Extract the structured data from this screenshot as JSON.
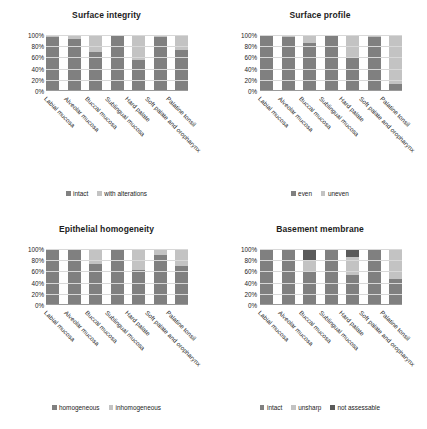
{
  "colors": {
    "dark": "#808080",
    "light": "#c3c3c3",
    "darkest": "#5a5a5a",
    "gridline": "#d8d8d8",
    "text": "#232323"
  },
  "axis": {
    "ticks": [
      "100%",
      "80%",
      "60%",
      "40%",
      "20%",
      "0%"
    ],
    "ymin": 0,
    "ymax": 100
  },
  "categories": [
    "Labial mucosa",
    "Alveolar mucosa",
    "Buccal mucosa",
    "Sublingual mucosa",
    "Hard palate",
    "Soft palate and oropharynx",
    "Palatine tonsil"
  ],
  "chart_data": [
    {
      "type": "bar",
      "id": "surface-integrity",
      "title": "Surface integrity",
      "xlabel": "",
      "ylabel": "",
      "ylim": [
        0,
        100
      ],
      "stacked": true,
      "grid": true,
      "legend_position": "bottom",
      "categories": [
        "Labial mucosa",
        "Alveolar mucosa",
        "Buccal mucosa",
        "Sublingual mucosa",
        "Hard palate",
        "Soft palate and oropharynx",
        "Palatine tonsil"
      ],
      "series": [
        {
          "name": "intact",
          "color": "#808080",
          "values": [
            96,
            92,
            69,
            100,
            55,
            96,
            74
          ]
        },
        {
          "name": "with alterations",
          "color": "#c3c3c3",
          "values": [
            4,
            8,
            31,
            0,
            45,
            4,
            26
          ]
        }
      ]
    },
    {
      "type": "bar",
      "id": "surface-profile",
      "title": "Surface profile",
      "xlabel": "",
      "ylabel": "",
      "ylim": [
        0,
        100
      ],
      "stacked": true,
      "grid": true,
      "legend_position": "bottom",
      "categories": [
        "Labial mucosa",
        "Alveolar mucosa",
        "Buccal mucosa",
        "Sublingual mucosa",
        "Hard palate",
        "Soft palate and oropharynx",
        "Palatine tonsil"
      ],
      "series": [
        {
          "name": "even",
          "color": "#808080",
          "values": [
            100,
            96,
            85,
            100,
            61,
            96,
            12
          ]
        },
        {
          "name": "uneven",
          "color": "#c3c3c3",
          "values": [
            0,
            4,
            15,
            0,
            39,
            4,
            88
          ]
        }
      ]
    },
    {
      "type": "bar",
      "id": "epithelial-homogeneity",
      "title": "Epithelial homogeneity",
      "xlabel": "",
      "ylabel": "",
      "ylim": [
        0,
        100
      ],
      "stacked": true,
      "grid": true,
      "legend_position": "bottom",
      "categories": [
        "Labial mucosa",
        "Alveolar mucosa",
        "Buccal mucosa",
        "Sublingual mucosa",
        "Hard palate",
        "Soft palate and oropharynx",
        "Palatine tonsil"
      ],
      "series": [
        {
          "name": "homogeneous",
          "color": "#808080",
          "values": [
            100,
            100,
            74,
            100,
            62,
            89,
            70
          ]
        },
        {
          "name": "inhomogeneous",
          "color": "#c3c3c3",
          "values": [
            0,
            0,
            26,
            0,
            38,
            11,
            30
          ]
        }
      ]
    },
    {
      "type": "bar",
      "id": "basement-membrane",
      "title": "Basement membrane",
      "xlabel": "",
      "ylabel": "",
      "ylim": [
        0,
        100
      ],
      "stacked": true,
      "grid": true,
      "legend_position": "bottom",
      "categories": [
        "Labial mucosa",
        "Alveolar mucosa",
        "Buccal mucosa",
        "Sublingual mucosa",
        "Hard palate",
        "Soft palate and oropharynx",
        "Palatine tonsil"
      ],
      "series": [
        {
          "name": "intact",
          "color": "#808080",
          "values": [
            100,
            100,
            61,
            100,
            53,
            100,
            47
          ]
        },
        {
          "name": "unsharp",
          "color": "#c3c3c3",
          "values": [
            0,
            0,
            19,
            0,
            33,
            0,
            53
          ]
        },
        {
          "name": "not assessable",
          "color": "#5a5a5a",
          "values": [
            0,
            0,
            20,
            0,
            14,
            0,
            0
          ]
        }
      ]
    }
  ]
}
